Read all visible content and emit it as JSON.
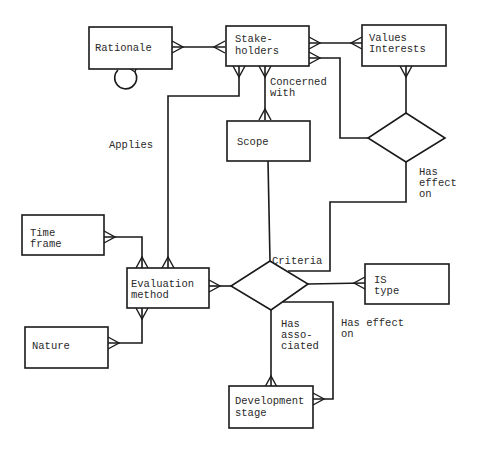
{
  "diagram": {
    "type": "entity-relationship",
    "entities": {
      "rationale": {
        "line1": "Rationale",
        "line2": ""
      },
      "stakeholders": {
        "line1": "Stake-",
        "line2": "holders"
      },
      "values_interests": {
        "line1": "Values",
        "line2": "Interests"
      },
      "scope": {
        "line1": "Scope",
        "line2": ""
      },
      "time_frame": {
        "line1": "Time",
        "line2": "frame"
      },
      "evaluation_method": {
        "line1": "Evaluation",
        "line2": "method"
      },
      "nature": {
        "line1": "Nature",
        "line2": ""
      },
      "is_type": {
        "line1": "IS",
        "line2": "type"
      },
      "development_stage": {
        "line1": "Development",
        "line2": "stage"
      }
    },
    "relationships": {
      "applies": {
        "line1": "Applies"
      },
      "concerned_with": {
        "line1": "Concerned",
        "line2": "with"
      },
      "has_effect_on_values": {
        "line1": "Has",
        "line2": "effect",
        "line3": "on"
      },
      "criteria": {
        "line1": "Criteria"
      },
      "has_associated": {
        "line1": "Has",
        "line2": "asso-",
        "line3": "ciated"
      },
      "has_effect_on_stage": {
        "line1": "Has effect",
        "line2": "on"
      }
    },
    "colors": {
      "stroke": "#1a1a1a",
      "background": "#ffffff",
      "text": "#2a2a2a"
    }
  }
}
